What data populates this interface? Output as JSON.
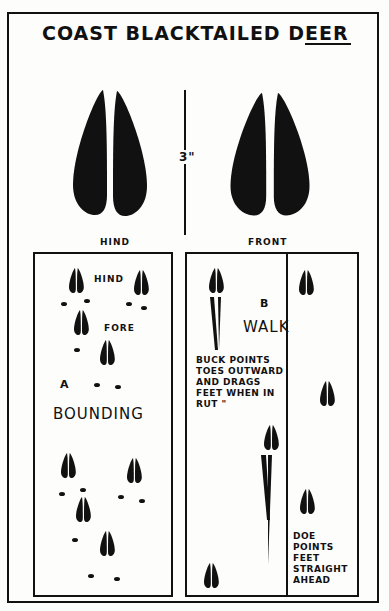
{
  "title": "COAST BLACKTAILED DEER",
  "top_prints": {
    "hind_label": "HIND",
    "front_label": "FRONT",
    "scale_label": "3\""
  },
  "panel_a": {
    "letter": "A",
    "gait": "BOUNDING",
    "hind_label": "HIND",
    "fore_label": "FORE"
  },
  "panel_b": {
    "letter": "B",
    "gait": "WALK",
    "buck_note": "BUCK POINTS TOES OUTWARD AND DRAGS FEET WHEN IN RUT \"",
    "doe_note": "DOE POINTS FEET STRAIGHT AHEAD"
  },
  "colors": {
    "ink": "#111111",
    "paper": "#fdfdfb"
  }
}
